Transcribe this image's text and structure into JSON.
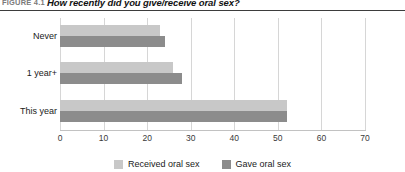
{
  "figure": {
    "number": "FIGURE 4.1",
    "title": "How recently did you give/receive oral sex?"
  },
  "legend": {
    "items": [
      {
        "label": "Received oral sex",
        "color": "#c8c8c8"
      },
      {
        "label": "Gave oral sex",
        "color": "#8c8c8c"
      }
    ]
  },
  "axis": {
    "ticks": [
      "0",
      "10",
      "20",
      "30",
      "40",
      "50",
      "60",
      "70"
    ]
  },
  "chart_data": {
    "type": "bar",
    "orientation": "horizontal",
    "title": "How recently did you give/receive oral sex?",
    "categories": [
      "Never",
      "1 year+",
      "This year"
    ],
    "series": [
      {
        "name": "Received oral sex",
        "color": "#c8c8c8",
        "values": [
          23,
          26,
          52
        ]
      },
      {
        "name": "Gave oral sex",
        "color": "#8c8c8c",
        "values": [
          24,
          28,
          52
        ]
      }
    ],
    "xlabel": "",
    "ylabel": "",
    "xlim": [
      0,
      70
    ],
    "xticks": [
      0,
      10,
      20,
      30,
      40,
      50,
      60,
      70
    ],
    "grid": true,
    "legend_position": "bottom-center"
  }
}
